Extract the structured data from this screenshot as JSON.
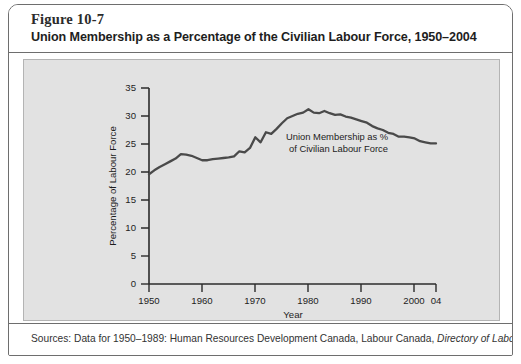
{
  "figure": {
    "number": "Figure 10-7",
    "title": "Union Membership as a Percentage of the Civilian Labour Force, 1950–2004"
  },
  "source": {
    "prefix": "Sources: Data for 1950–1989: Human Resources Development Canada, Labour Canada, ",
    "italic": "Directory of Labour"
  },
  "annotation": {
    "line1": "Union Membership as %",
    "line2": "of Civilian Labour Force"
  },
  "colors": {
    "panel": "#e2e2e2",
    "line": "#4a4a4a",
    "axis": "#2b2b2b",
    "border": "#6e6e6e"
  },
  "chart_data": {
    "type": "line",
    "title": "Union Membership as a Percentage of the Civilian Labour Force, 1950–2004",
    "xlabel": "Year",
    "ylabel": "Percentage of Labour Force",
    "xlim": [
      1950,
      2004
    ],
    "ylim": [
      0,
      35
    ],
    "ytick_values": [
      0,
      5,
      10,
      15,
      20,
      25,
      30,
      35
    ],
    "ytick_labels": [
      "0",
      "5",
      "10",
      "15",
      "20",
      "25",
      "30",
      "35"
    ],
    "xtick_values": [
      1950,
      1960,
      1970,
      1980,
      1990,
      2000,
      2004
    ],
    "xtick_labels": [
      "1950",
      "1960",
      "1970",
      "1980",
      "1990",
      "2000",
      "04"
    ],
    "grid": false,
    "legend": false,
    "series": [
      {
        "name": "Union Membership as % of Civilian Labour Force",
        "x": [
          1950,
          1951,
          1952,
          1953,
          1954,
          1955,
          1956,
          1957,
          1958,
          1959,
          1960,
          1961,
          1962,
          1963,
          1964,
          1965,
          1966,
          1967,
          1968,
          1969,
          1970,
          1971,
          1972,
          1973,
          1974,
          1975,
          1976,
          1977,
          1978,
          1979,
          1980,
          1981,
          1982,
          1983,
          1984,
          1985,
          1986,
          1987,
          1988,
          1989,
          1990,
          1991,
          1992,
          1993,
          1994,
          1995,
          1996,
          1997,
          1998,
          1999,
          2000,
          2001,
          2002,
          2003,
          2004
        ],
        "values": [
          19.6,
          20.3,
          20.9,
          21.4,
          21.9,
          22.4,
          23.2,
          23.1,
          22.9,
          22.5,
          22.1,
          22.1,
          22.3,
          22.4,
          22.5,
          22.6,
          22.8,
          23.7,
          23.5,
          24.3,
          26.2,
          25.3,
          27.1,
          26.8,
          27.7,
          28.7,
          29.6,
          30.0,
          30.4,
          30.6,
          31.2,
          30.6,
          30.5,
          30.9,
          30.5,
          30.2,
          30.3,
          29.9,
          29.7,
          29.4,
          29.1,
          28.8,
          28.2,
          27.8,
          27.5,
          27.0,
          26.8,
          26.3,
          26.3,
          26.2,
          26.0,
          25.5,
          25.3,
          25.1,
          25.1
        ]
      }
    ]
  }
}
